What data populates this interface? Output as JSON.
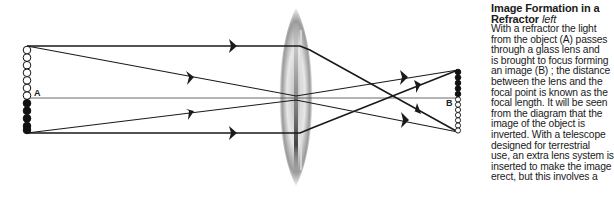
{
  "diagram": {
    "title": "Image Formation in a Refractor",
    "object_label": "A",
    "image_label": "B",
    "elements": {
      "object": {
        "x": 27,
        "y_top": 46,
        "y_bottom": 133,
        "white_circles": 7,
        "black_circles": 5
      },
      "lens": {
        "cx": 296,
        "cy": 97,
        "rx": 16,
        "ry": 89
      },
      "optical_axis_y": 98,
      "image": {
        "x": 458,
        "y_top": 70,
        "y_bottom": 132,
        "black_circles": 5,
        "white_circles": 7
      }
    },
    "colors": {
      "ray": "#1a1a1a",
      "lens_dark": "#555555",
      "lens_light": "#e6e6e6"
    }
  },
  "caption": {
    "title": "Image Formation in a",
    "title_line2": "Refractor",
    "title_italic": "left",
    "body_lines": [
      "With a refractor the light",
      "from the object (A) passes",
      "through a glass lens and",
      "is brought to focus forming",
      "an image (B) ; the distance",
      "between the lens and the",
      "focal point is known as the",
      "focal length. It will be seen",
      "from the diagram that the",
      "image of the object is",
      "inverted. With a telescope",
      "designed for terrestrial",
      "use, an extra lens system is",
      "inserted to make the image",
      "erect, but this involves a"
    ]
  }
}
